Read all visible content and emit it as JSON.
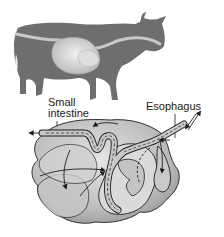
{
  "figure": {
    "labels": {
      "small_intestine_line1": "Small",
      "small_intestine_line2": "intestine",
      "esophagus": "Esophagus"
    },
    "colors": {
      "cow_silhouette": "#6e6e6e",
      "digestive_tract_highlight": "#c8c8c8",
      "stomach_fill": "#bdbdbd",
      "stomach_light": "#dcdcdc",
      "outline": "#1e1e1e",
      "background": "#ffffff"
    }
  }
}
